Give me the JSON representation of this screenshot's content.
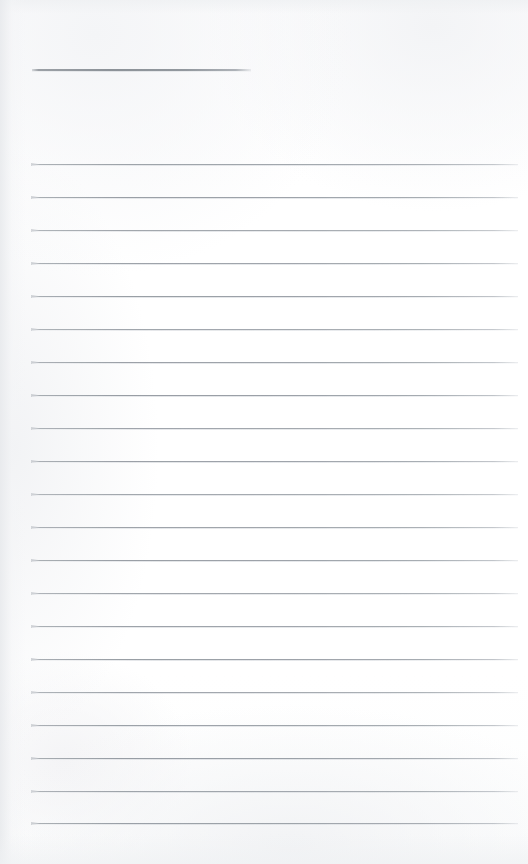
{
  "document": {
    "kind": "lined-note-page",
    "title_text": "",
    "body_text": "",
    "page_width": 528,
    "page_height": 864,
    "background_color": "#ffffff",
    "rule_color": "#969ca2",
    "heading_rule_color": "#8c9298"
  },
  "heading_rule": {
    "label": "",
    "x": 32,
    "y": 69,
    "width": 219,
    "height": 2
  },
  "ruled_lines": {
    "count": 21,
    "x": 32,
    "width": 486,
    "first_y": 164,
    "spacing": 32.95,
    "items": [
      {
        "index": 1,
        "y": 164,
        "text": ""
      },
      {
        "index": 2,
        "y": 197,
        "text": ""
      },
      {
        "index": 3,
        "y": 230,
        "text": ""
      },
      {
        "index": 4,
        "y": 263,
        "text": ""
      },
      {
        "index": 5,
        "y": 296,
        "text": ""
      },
      {
        "index": 6,
        "y": 329,
        "text": ""
      },
      {
        "index": 7,
        "y": 362,
        "text": ""
      },
      {
        "index": 8,
        "y": 395,
        "text": ""
      },
      {
        "index": 9,
        "y": 428,
        "text": ""
      },
      {
        "index": 10,
        "y": 461,
        "text": ""
      },
      {
        "index": 11,
        "y": 494,
        "text": ""
      },
      {
        "index": 12,
        "y": 527,
        "text": ""
      },
      {
        "index": 13,
        "y": 560,
        "text": ""
      },
      {
        "index": 14,
        "y": 593,
        "text": ""
      },
      {
        "index": 15,
        "y": 626,
        "text": ""
      },
      {
        "index": 16,
        "y": 659,
        "text": ""
      },
      {
        "index": 17,
        "y": 692,
        "text": ""
      },
      {
        "index": 18,
        "y": 725,
        "text": ""
      },
      {
        "index": 19,
        "y": 758,
        "text": ""
      },
      {
        "index": 20,
        "y": 791,
        "text": ""
      },
      {
        "index": 21,
        "y": 823,
        "text": ""
      }
    ]
  }
}
